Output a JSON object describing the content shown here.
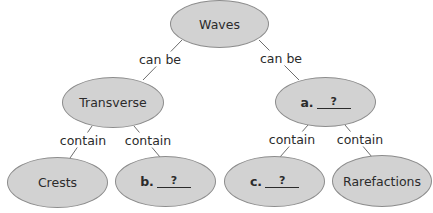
{
  "diagram": {
    "type": "concept-map",
    "colors": {
      "node_fill": "#d2d2d2",
      "node_border": "#8c8c8c",
      "text": "#2b2b2b",
      "line": "#6e6e6e"
    },
    "nodes": {
      "waves": {
        "text": "Waves"
      },
      "transverse": {
        "text": "Transverse"
      },
      "a": {
        "prefix": "a.",
        "blank": "?"
      },
      "crests": {
        "text": "Crests"
      },
      "b": {
        "prefix": "b.",
        "blank": "?"
      },
      "c": {
        "prefix": "c.",
        "blank": "?"
      },
      "rarefactions": {
        "text": "Rarefactions"
      }
    },
    "links": {
      "waves_transverse": "can be",
      "waves_a": "can be",
      "transverse_crests": "contain",
      "transverse_b": "contain",
      "a_c": "contain",
      "a_rarefactions": "contain"
    }
  }
}
